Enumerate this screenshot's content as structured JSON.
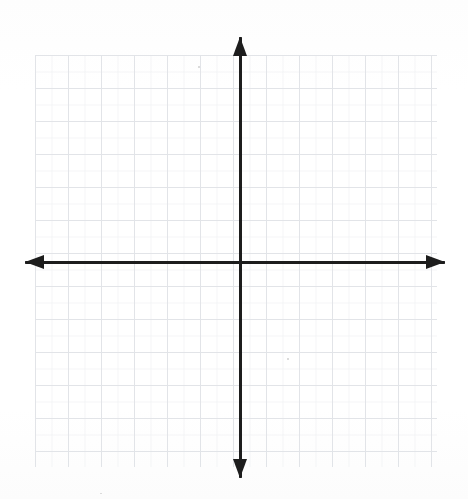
{
  "document": {
    "title": "Blank Coordinate Plane",
    "kind": "math-worksheet-graph",
    "paper": "graph-paper-scan",
    "background_color": "#fefefe"
  },
  "chart_data": {
    "type": "scatter",
    "title": "",
    "subtitle": "",
    "xlabel": "",
    "ylabel": "",
    "series": [],
    "x": [],
    "values": [],
    "categories": [],
    "annotations": [],
    "legend": {
      "entries": [],
      "position": "none"
    },
    "grid": {
      "visible": true,
      "style": "graph-paper",
      "minor_spacing_px": 16.5,
      "major_spacing_px": 33,
      "minor_color": "#e9ebee",
      "major_color": "#dfe2e6",
      "left_px": 35,
      "top_px": 55,
      "right_px": 437,
      "bottom_px": 467
    },
    "axes": {
      "origin_px": {
        "x": 240,
        "y": 262
      },
      "x_axis": {
        "label": "x",
        "visible": true,
        "color": "#1d1d1d",
        "thickness_px": 3,
        "start_px": 25,
        "end_px": 445,
        "arrow_start": true,
        "arrow_end": true,
        "ticks": [],
        "tick_labels": []
      },
      "y_axis": {
        "label": "y",
        "visible": true,
        "color": "#1d1d1d",
        "thickness_px": 3,
        "start_px": 37,
        "end_px": 478,
        "arrow_start": true,
        "arrow_end": true,
        "ticks": [],
        "tick_labels": []
      },
      "xlim": [
        -12,
        12
      ],
      "ylim": [
        -12,
        12
      ]
    },
    "quadrants": [
      "I",
      "II",
      "III",
      "IV"
    ]
  },
  "colors": {
    "axis": "#1d1d1d",
    "grid_minor": "#e9ebee",
    "grid_major": "#dfe2e6",
    "background": "#fefefe"
  }
}
